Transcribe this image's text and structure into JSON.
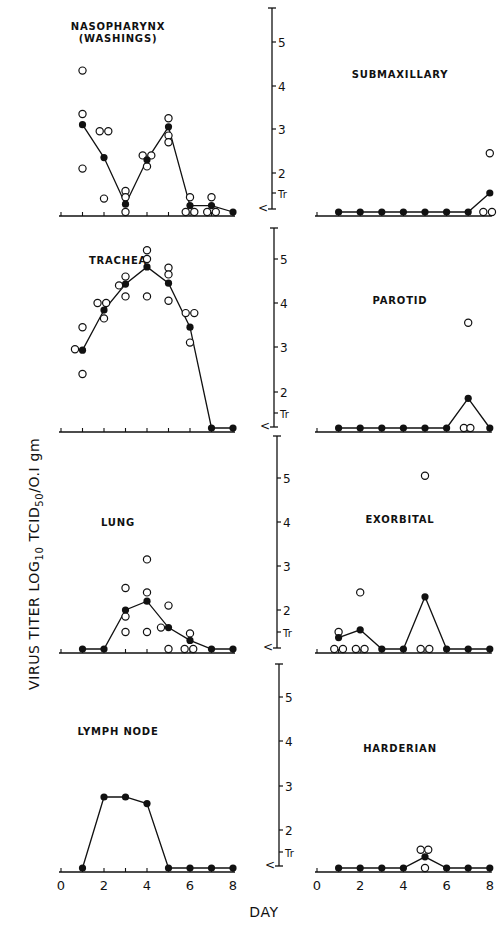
{
  "chart_data": {
    "type": "line",
    "figure_title": "",
    "ylabel": "VIRUS TITER LOG10 TCID50/0.1 gm",
    "xlabel": "DAY",
    "x_ticks": [
      0,
      2,
      4,
      6,
      8
    ],
    "x_range": [
      0,
      8
    ],
    "y_tick_labels": [
      "<",
      "Tr",
      "2",
      "3",
      "4",
      "5"
    ],
    "y_tick_values": [
      1.0,
      1.5,
      2,
      3,
      4,
      5
    ],
    "y_range": [
      0.9,
      5.8
    ],
    "legend": {
      "filled_circle": "mean titer (connected by line)",
      "open_circle": "individual animal titer"
    },
    "panels": [
      {
        "name": "NASOPHARYNX (WASHINGS)",
        "title_lines": [
          "NASOPHARYNX",
          "(WASHINGS)"
        ],
        "column": "left",
        "row": 0,
        "mean": {
          "days": [
            1,
            2,
            3,
            4,
            5,
            6,
            7,
            8
          ],
          "values": [
            3.1,
            2.35,
            1.1,
            2.3,
            3.05,
            1.05,
            1.05,
            1.0
          ]
        },
        "individual": [
          [
            1,
            4.35
          ],
          [
            1,
            3.35
          ],
          [
            1,
            2.1
          ],
          [
            1.8,
            2.95
          ],
          [
            2.2,
            2.95
          ],
          [
            2,
            1.3
          ],
          [
            3,
            1.55
          ],
          [
            3,
            1.35
          ],
          [
            3,
            0.95
          ],
          [
            3.8,
            2.4
          ],
          [
            4.2,
            2.4
          ],
          [
            4,
            2.15
          ],
          [
            5,
            3.25
          ],
          [
            5,
            2.85
          ],
          [
            5,
            2.7
          ],
          [
            6,
            1.35
          ],
          [
            5.8,
            0.95
          ],
          [
            6.2,
            0.95
          ],
          [
            7,
            1.35
          ],
          [
            6.8,
            0.95
          ],
          [
            7.2,
            0.95
          ]
        ]
      },
      {
        "name": "SUBMAXILLARY",
        "title_lines": [
          "SUBMAXILLARY"
        ],
        "column": "right",
        "row": 0,
        "mean": {
          "days": [
            1,
            2,
            3,
            4,
            5,
            6,
            7,
            8
          ],
          "values": [
            1.0,
            1.0,
            1.0,
            1.0,
            1.0,
            1.0,
            1.0,
            1.5
          ]
        },
        "individual": [
          [
            8,
            2.45
          ],
          [
            7.7,
            1.0
          ],
          [
            8.1,
            1.0
          ]
        ]
      },
      {
        "name": "TRACHEA",
        "title_lines": [
          "TRACHEA"
        ],
        "column": "left",
        "row": 1,
        "mean": {
          "days": [
            1,
            2,
            3,
            4,
            5,
            6,
            7,
            8
          ],
          "values": [
            2.93,
            3.84,
            4.43,
            4.82,
            4.45,
            3.45,
            1.0,
            1.0
          ]
        },
        "individual": [
          [
            0.65,
            2.95
          ],
          [
            1,
            3.45
          ],
          [
            1,
            2.4
          ],
          [
            1.7,
            4.0
          ],
          [
            2.1,
            4.0
          ],
          [
            2,
            3.65
          ],
          [
            2.7,
            4.4
          ],
          [
            3,
            4.6
          ],
          [
            3,
            4.15
          ],
          [
            4,
            5.2
          ],
          [
            4,
            5.0
          ],
          [
            4,
            4.15
          ],
          [
            5,
            4.8
          ],
          [
            5,
            4.65
          ],
          [
            5,
            4.05
          ],
          [
            5.8,
            3.77
          ],
          [
            6.2,
            3.77
          ],
          [
            6,
            3.1
          ]
        ]
      },
      {
        "name": "PAROTID",
        "title_lines": [
          "PAROTID"
        ],
        "column": "right",
        "row": 1,
        "mean": {
          "days": [
            1,
            2,
            3,
            4,
            5,
            6,
            7,
            8
          ],
          "values": [
            1.0,
            1.0,
            1.0,
            1.0,
            1.0,
            1.0,
            1.85,
            1.0
          ]
        },
        "individual": [
          [
            7,
            3.55
          ],
          [
            6.8,
            1.0
          ],
          [
            7.1,
            1.0
          ]
        ]
      },
      {
        "name": "LUNG",
        "title_lines": [
          "LUNG"
        ],
        "column": "left",
        "row": 2,
        "mean": {
          "days": [
            1,
            2,
            3,
            4,
            5,
            6,
            7,
            8
          ],
          "values": [
            0.95,
            0.95,
            2.0,
            2.2,
            1.6,
            1.2,
            0.95,
            0.95
          ]
        },
        "individual": [
          [
            3,
            2.5
          ],
          [
            3,
            1.85
          ],
          [
            3,
            1.5
          ],
          [
            4,
            3.15
          ],
          [
            4,
            2.4
          ],
          [
            4,
            1.5
          ],
          [
            5,
            2.1
          ],
          [
            4.65,
            1.6
          ],
          [
            5,
            0.95
          ],
          [
            6,
            1.45
          ],
          [
            5.75,
            0.95
          ],
          [
            6.15,
            0.95
          ]
        ]
      },
      {
        "name": "EXORBITAL",
        "title_lines": [
          "EXORBITAL"
        ],
        "column": "right",
        "row": 2,
        "mean": {
          "days": [
            1,
            2,
            3,
            4,
            5,
            6,
            7,
            8
          ],
          "values": [
            1.3,
            1.55,
            1.0,
            1.0,
            2.3,
            1.0,
            1.0,
            1.0
          ]
        },
        "individual": [
          [
            1,
            1.5
          ],
          [
            0.8,
            1.0
          ],
          [
            1.2,
            1.0
          ],
          [
            2,
            2.4
          ],
          [
            1.8,
            1.0
          ],
          [
            2.2,
            1.0
          ],
          [
            5,
            5.05
          ],
          [
            4.8,
            1.0
          ],
          [
            5.2,
            1.0
          ]
        ]
      },
      {
        "name": "LYMPH NODE",
        "title_lines": [
          "LYMPH NODE"
        ],
        "column": "left",
        "row": 3,
        "mean": {
          "days": [
            1,
            2,
            3,
            4,
            5,
            6,
            7,
            8
          ],
          "values": [
            1.0,
            2.75,
            2.75,
            2.6,
            1.0,
            1.0,
            1.0,
            1.0
          ]
        },
        "individual": []
      },
      {
        "name": "HARDERIAN",
        "title_lines": [
          "HARDERIAN"
        ],
        "column": "right",
        "row": 3,
        "mean": {
          "days": [
            1,
            2,
            3,
            4,
            5,
            6,
            7,
            8
          ],
          "values": [
            1.0,
            1.0,
            1.0,
            1.0,
            1.3,
            1.0,
            1.0,
            1.0
          ]
        },
        "individual": [
          [
            4.8,
            1.55
          ],
          [
            5.15,
            1.55
          ],
          [
            5,
            1.0
          ]
        ]
      }
    ]
  },
  "labels": {
    "ylabel_parts": {
      "main": "VIRUS TITER LOG",
      "sub1": "10",
      "mid": " TCID",
      "sub2": "50",
      "end": "/O.I gm"
    },
    "xlabel": "DAY",
    "y_ticks": [
      {
        "label": "5",
        "value": 5
      },
      {
        "label": "4",
        "value": 4
      },
      {
        "label": "3",
        "value": 3
      },
      {
        "label": "2",
        "value": 2
      },
      {
        "label": "Tr",
        "value": 1.5
      },
      {
        "label": "<",
        "value": 1.0
      }
    ],
    "x_tick_labels": [
      "0",
      "2",
      "4",
      "6",
      "8"
    ]
  },
  "layout": {
    "rows": [
      {
        "top": 8,
        "y5": 42,
        "y4": 86,
        "y3": 129,
        "y2": 173,
        "ytr": 193,
        "ylt": 207,
        "baseline": 216
      },
      {
        "top": 228,
        "y5": 259,
        "y4": 303,
        "y3": 347,
        "y2": 392,
        "ytr": 413,
        "ylt": 425,
        "baseline": 432
      },
      {
        "top": 436,
        "y5": 478,
        "y4": 522,
        "y3": 566,
        "y2": 610,
        "ytr": 632,
        "ylt": 646,
        "baseline": 653
      },
      {
        "top": 664,
        "y5": 697,
        "y4": 741,
        "y3": 786,
        "y2": 830,
        "ytr": 852,
        "ylt": 864,
        "baseline": 872
      }
    ],
    "axis_x": [
      272,
      274,
      277,
      279
    ],
    "left_x0": 61,
    "left_dx": 21.5,
    "right_x0": 317,
    "right_dx": 21.6,
    "colors": {
      "ink": "#111111",
      "paper": "#ffffff"
    }
  }
}
